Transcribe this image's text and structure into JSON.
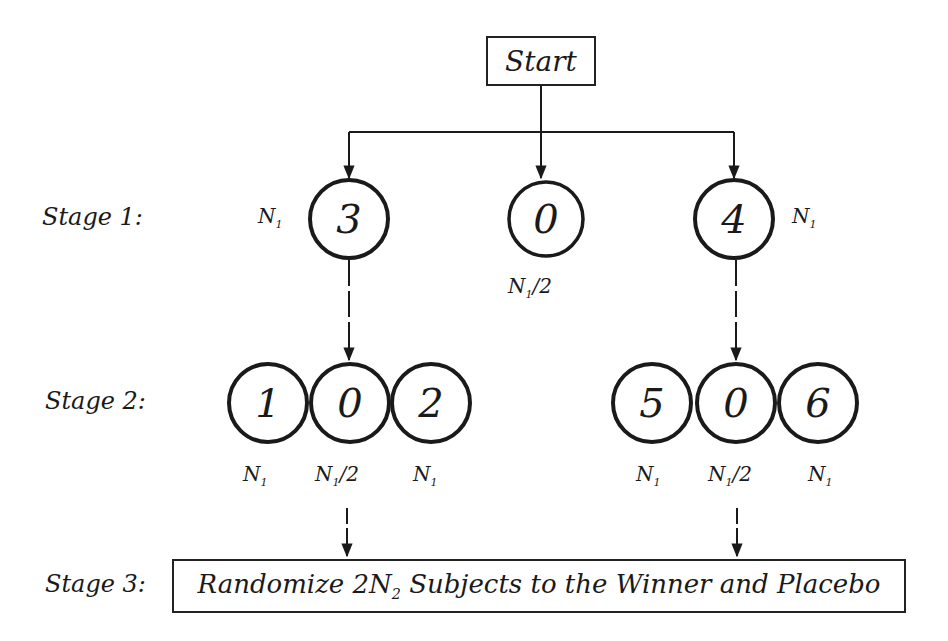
{
  "diagram": {
    "start": {
      "label": "Start"
    },
    "stages": [
      {
        "label": "Stage 1:"
      },
      {
        "label": "Stage 2:"
      },
      {
        "label": "Stage 3:"
      }
    ],
    "stage1": {
      "nodes": [
        {
          "id": "3",
          "size": "N1"
        },
        {
          "id": "0",
          "size": "N1/2"
        },
        {
          "id": "4",
          "size": "N1"
        }
      ]
    },
    "stage2": {
      "groups": [
        {
          "parent": "3",
          "nodes": [
            {
              "id": "1",
              "size": "N1"
            },
            {
              "id": "0",
              "size": "N1/2"
            },
            {
              "id": "2",
              "size": "N1"
            }
          ]
        },
        {
          "parent": "4",
          "nodes": [
            {
              "id": "5",
              "size": "N1"
            },
            {
              "id": "0",
              "size": "N1/2"
            },
            {
              "id": "6",
              "size": "N1"
            }
          ]
        }
      ]
    },
    "stage3": {
      "box_text": "Randomize 2N2 Subjects to the Winner and Placebo",
      "box_prefix": "Randomize 2",
      "box_n": "N",
      "box_sub": "2",
      "box_suffix": " Subjects to the Winner and Placebo"
    },
    "symbols": {
      "n": "N",
      "n_sub": "1",
      "half": "/2"
    },
    "colors": {
      "stroke": "#1a1a1a",
      "background": "#ffffff"
    }
  }
}
